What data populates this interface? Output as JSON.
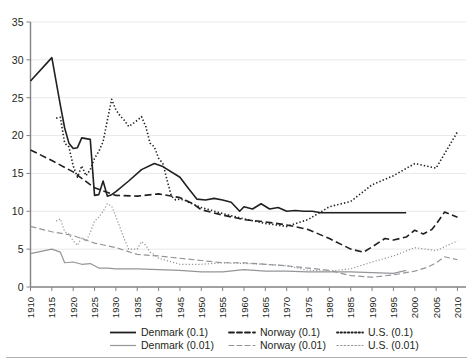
{
  "chart_data": {
    "type": "line",
    "title": "",
    "subtitle": "",
    "xlabel": "",
    "ylabel": "",
    "xlim": [
      1910,
      2012
    ],
    "ylim": [
      0,
      35
    ],
    "grid": true,
    "legend_position": "bottom",
    "y_ticks": [
      "0",
      "5",
      "10",
      "15",
      "20",
      "25",
      "30",
      "35"
    ],
    "x_ticks": [
      "1910",
      "1915",
      "1920",
      "1925",
      "1930",
      "1935",
      "1940",
      "1945",
      "1950",
      "1955",
      "1960",
      "1965",
      "1970",
      "1975",
      "1980",
      "1985",
      "1990",
      "1995",
      "2000",
      "2005",
      "2010"
    ],
    "colors": {
      "top_decile": "#231f20",
      "top_percentile": "#939598"
    },
    "series": [
      {
        "name": "Denmark (0.1)",
        "style": "solid",
        "color": "#231f20",
        "x": [
          1910,
          1915,
          1917,
          1918,
          1919,
          1920,
          1921,
          1922,
          1923,
          1924,
          1925,
          1926,
          1927,
          1928,
          1929,
          1930,
          1933,
          1936,
          1939,
          1941,
          1945,
          1947,
          1949,
          1951,
          1953,
          1955,
          1957,
          1959,
          1960,
          1962,
          1964,
          1966,
          1968,
          1970,
          1972,
          1974,
          1976,
          1978,
          1980,
          1982,
          1984,
          1986,
          1988,
          1990,
          1992,
          1994,
          1996,
          1998
        ],
        "y": [
          27.2,
          30.3,
          24.0,
          21.0,
          19.0,
          18.3,
          18.4,
          19.7,
          19.6,
          19.5,
          12.1,
          12.2,
          14.0,
          12.0,
          12.2,
          12.6,
          14.0,
          15.5,
          16.3,
          15.9,
          14.5,
          13.0,
          11.6,
          11.5,
          11.7,
          11.5,
          11.2,
          10.0,
          10.6,
          10.3,
          11.0,
          10.3,
          10.5,
          10.0,
          10.1,
          10.0,
          10.0,
          9.8,
          9.8,
          9.8,
          9.8,
          9.8,
          9.8,
          9.8,
          9.8,
          9.8,
          9.8,
          9.8
        ]
      },
      {
        "name": "Denmark (0.01)",
        "style": "solid",
        "color": "#939598",
        "x": [
          1910,
          1915,
          1917,
          1918,
          1920,
          1922,
          1924,
          1926,
          1928,
          1930,
          1935,
          1940,
          1945,
          1950,
          1955,
          1960,
          1965,
          1970,
          1975,
          1980,
          1985,
          1990,
          1995,
          1998
        ],
        "y": [
          4.4,
          5.0,
          4.6,
          3.2,
          3.3,
          3.0,
          3.1,
          2.5,
          2.5,
          2.4,
          2.4,
          2.3,
          2.2,
          2.0,
          2.0,
          2.3,
          2.1,
          2.1,
          2.0,
          2.0,
          2.0,
          1.9,
          1.8,
          2.2
        ]
      },
      {
        "name": "Norway (0.1)",
        "style": "dashed",
        "color": "#231f20",
        "x": [
          1910,
          1915,
          1920,
          1925,
          1930,
          1935,
          1940,
          1945,
          1948,
          1950,
          1955,
          1960,
          1965,
          1970,
          1975,
          1980,
          1985,
          1988,
          1990,
          1993,
          1995,
          1998,
          2000,
          2002,
          2004,
          2005,
          2007,
          2010
        ],
        "y": [
          18.1,
          16.7,
          15.2,
          13.1,
          12.1,
          12.0,
          12.3,
          11.8,
          11.0,
          10.2,
          9.5,
          8.9,
          8.6,
          8.2,
          7.6,
          6.4,
          5.0,
          4.6,
          5.3,
          6.4,
          6.2,
          6.6,
          7.5,
          7.0,
          7.6,
          8.3,
          9.9,
          9.2
        ]
      },
      {
        "name": "Norway (0.01)",
        "style": "dashed",
        "color": "#939598",
        "x": [
          1910,
          1915,
          1920,
          1925,
          1930,
          1935,
          1940,
          1945,
          1950,
          1955,
          1960,
          1965,
          1970,
          1975,
          1980,
          1985,
          1990,
          1995,
          2000,
          2003,
          2005,
          2007,
          2010
        ],
        "y": [
          8.0,
          7.3,
          6.8,
          5.8,
          5.2,
          4.3,
          4.1,
          3.8,
          3.5,
          3.2,
          3.2,
          3.0,
          2.8,
          2.5,
          2.2,
          1.5,
          1.3,
          1.6,
          2.1,
          2.6,
          3.2,
          4.0,
          3.6
        ]
      },
      {
        "name": "U.S. (0.1)",
        "style": "dotted",
        "color": "#231f20",
        "x": [
          1916,
          1917,
          1918,
          1919,
          1920,
          1921,
          1922,
          1923,
          1924,
          1925,
          1926,
          1927,
          1928,
          1929,
          1930,
          1931,
          1932,
          1933,
          1934,
          1935,
          1936,
          1937,
          1938,
          1939,
          1940,
          1941,
          1942,
          1943,
          1944,
          1945,
          1946,
          1947,
          1950,
          1955,
          1960,
          1965,
          1970,
          1975,
          1980,
          1985,
          1990,
          1995,
          2000,
          2005,
          2010
        ],
        "y": [
          22.3,
          22.4,
          19.0,
          18.5,
          16.0,
          14.5,
          16.0,
          14.7,
          15.5,
          17.0,
          17.9,
          19.2,
          22.0,
          24.8,
          23.4,
          22.6,
          22.0,
          21.2,
          21.6,
          22.0,
          22.5,
          21.2,
          19.0,
          18.5,
          17.0,
          16.3,
          14.1,
          12.0,
          11.5,
          11.6,
          11.5,
          11.2,
          10.5,
          9.7,
          9.0,
          8.4,
          8.0,
          8.9,
          10.6,
          11.3,
          13.5,
          14.7,
          16.3,
          15.7,
          20.5
        ]
      },
      {
        "name": "U.S. (0.01)",
        "style": "dotted",
        "color": "#939598",
        "x": [
          1916,
          1917,
          1918,
          1919,
          1920,
          1921,
          1922,
          1923,
          1924,
          1925,
          1926,
          1927,
          1928,
          1929,
          1930,
          1931,
          1932,
          1933,
          1934,
          1935,
          1936,
          1937,
          1938,
          1939,
          1940,
          1945,
          1950,
          1955,
          1960,
          1965,
          1970,
          1975,
          1980,
          1985,
          1990,
          1995,
          2000,
          2005,
          2010
        ],
        "y": [
          8.7,
          9.0,
          7.3,
          7.0,
          6.1,
          5.5,
          6.6,
          6.0,
          7.2,
          8.7,
          9.2,
          10.0,
          11.0,
          10.7,
          9.3,
          7.8,
          6.3,
          5.0,
          5.0,
          5.0,
          6.0,
          5.5,
          4.6,
          4.3,
          3.8,
          3.0,
          3.0,
          3.2,
          3.1,
          3.0,
          2.8,
          2.2,
          2.1,
          2.4,
          3.3,
          4.1,
          5.2,
          4.8,
          6.1
        ]
      }
    ]
  },
  "legend": {
    "rows": [
      [
        {
          "label": "Denmark (0.1)",
          "style": "solid",
          "color": "#231f20",
          "icon": "solid-line-icon"
        },
        {
          "label": "Norway (0.1)",
          "style": "dashed",
          "color": "#231f20",
          "icon": "dashed-line-icon"
        },
        {
          "label": "U.S. (0.1)",
          "style": "dotted",
          "color": "#231f20",
          "icon": "dotted-line-icon"
        }
      ],
      [
        {
          "label": "Denmark (0.01)",
          "style": "solid",
          "color": "#939598",
          "icon": "solid-line-icon"
        },
        {
          "label": "Norway (0.01)",
          "style": "dashed",
          "color": "#939598",
          "icon": "dashed-line-icon"
        },
        {
          "label": "U.S. (0.01)",
          "style": "dotted",
          "color": "#939598",
          "icon": "dotted-line-icon"
        }
      ]
    ]
  }
}
